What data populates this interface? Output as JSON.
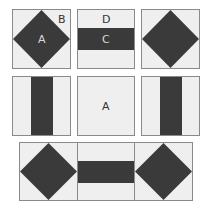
{
  "colors": {
    "fabric_dark": "#3a3a3a",
    "fabric_light": "#efefef",
    "outline": "#8a8a8a"
  },
  "blocks": [
    {
      "type": "square-in-square",
      "labels": {
        "center": "A",
        "corner": "B"
      }
    },
    {
      "type": "horizontal-band",
      "labels": {
        "band": "C",
        "background": "D"
      }
    },
    {
      "type": "square-in-square",
      "labels": {}
    },
    {
      "type": "vertical-band",
      "labels": {}
    },
    {
      "type": "plain",
      "labels": {
        "center": "A"
      }
    },
    {
      "type": "vertical-band",
      "labels": {}
    }
  ],
  "bottom_row": [
    {
      "type": "square-in-square"
    },
    {
      "type": "horizontal-band"
    },
    {
      "type": "square-in-square"
    }
  ]
}
